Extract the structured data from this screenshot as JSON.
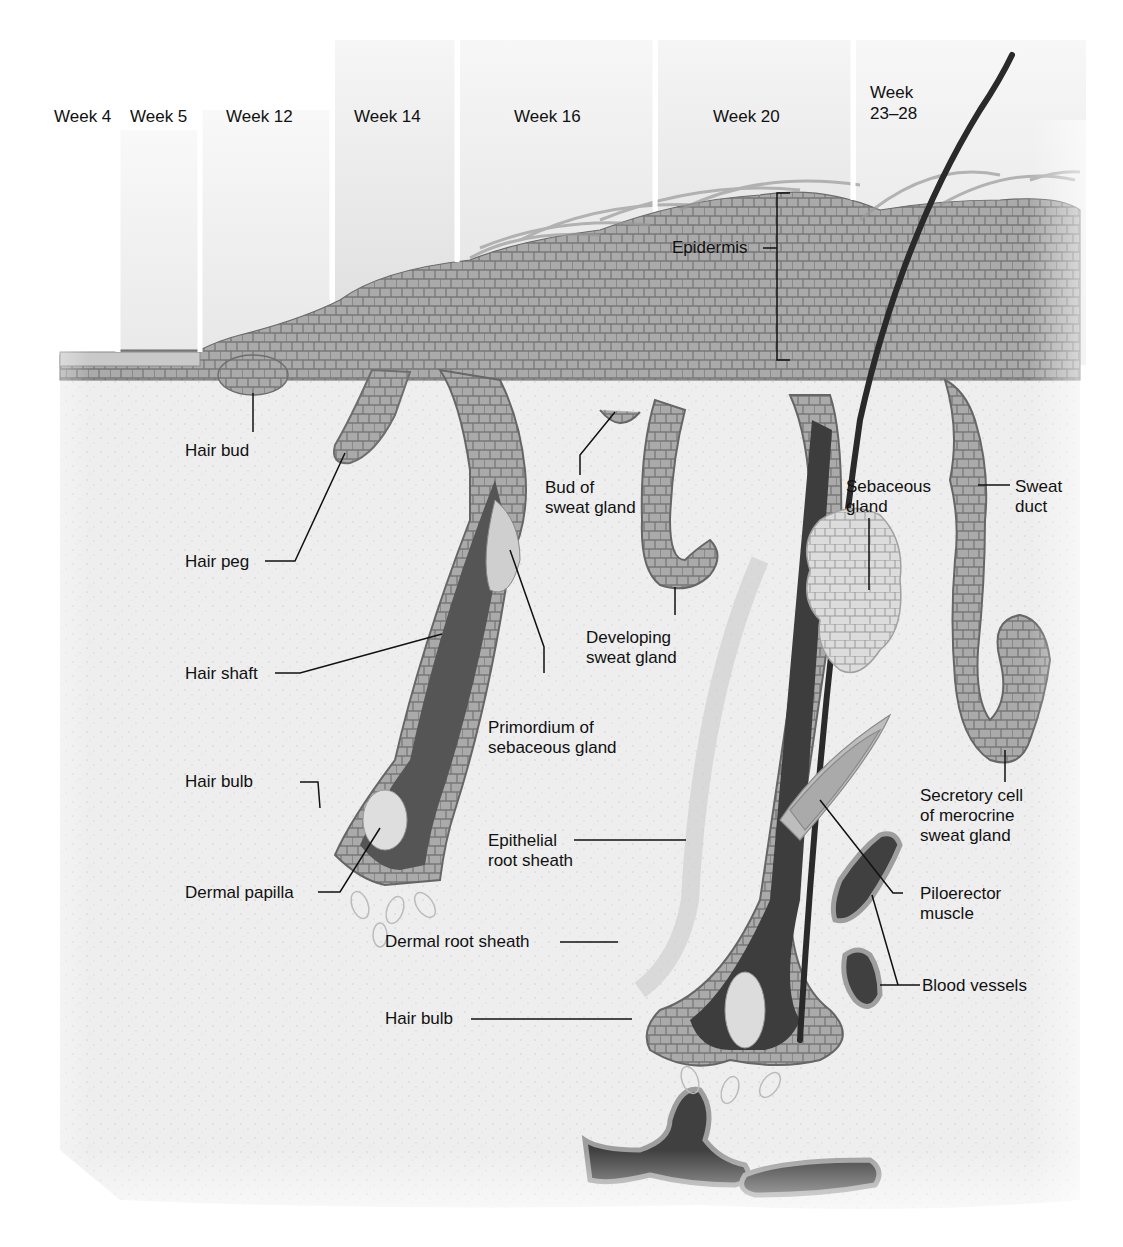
{
  "diagram": {
    "palette": {
      "background": "#ffffff",
      "dermis": "#ebebeb",
      "epidermis_cells": "#a9a9a9",
      "basal_cells": "#8c8c8c",
      "hair_shaft": "#2a2a2a",
      "follicle_dark": "#4a4a4a",
      "sebaceous": "#d8d8d8",
      "blood_vessel": "#3c3c3c",
      "label_text": "#111111",
      "leader_line": "#111111"
    },
    "stages": [
      {
        "label": "Week 4"
      },
      {
        "label": "Week 5"
      },
      {
        "label": "Week 12"
      },
      {
        "label": "Week 14"
      },
      {
        "label": "Week 16"
      },
      {
        "label": "Week 20"
      },
      {
        "label_line1": "Week",
        "label_line2": "23–28"
      }
    ],
    "labels": {
      "epidermis": "Epidermis",
      "hair_bud": "Hair bud",
      "hair_peg": "Hair peg",
      "hair_shaft": "Hair shaft",
      "hair_bulb_left": "Hair bulb",
      "dermal_papilla": "Dermal papilla",
      "bud_of_sweat_gland_1": "Bud of",
      "bud_of_sweat_gland_2": "sweat gland",
      "developing_sweat_gland_1": "Developing",
      "developing_sweat_gland_2": "sweat gland",
      "primordium_1": "Primordium of",
      "primordium_2": "sebaceous gland",
      "epithelial_root_sheath_1": "Epithelial",
      "epithelial_root_sheath_2": "root sheath",
      "dermal_root_sheath": "Dermal root sheath",
      "hair_bulb_right": "Hair bulb",
      "sebaceous_gland_1": "Sebaceous",
      "sebaceous_gland_2": "gland",
      "sweat_duct_1": "Sweat",
      "sweat_duct_2": "duct",
      "secretory_cell_1": "Secretory cell",
      "secretory_cell_2": "of merocrine",
      "secretory_cell_3": "sweat gland",
      "piloerector_1": "Piloerector",
      "piloerector_2": "muscle",
      "blood_vessels": "Blood vessels"
    }
  }
}
